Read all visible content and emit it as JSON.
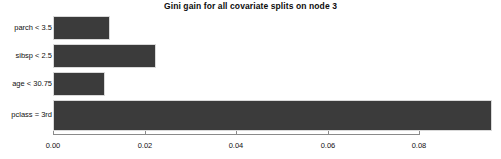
{
  "chart_data": {
    "type": "bar",
    "orientation": "horizontal",
    "title": "Gini gain for all covariate splits on node 3",
    "xlabel": "",
    "ylabel": "",
    "categories": [
      "parch < 3.5",
      "sibsp < 2.5",
      "age < 30.75",
      "pclass = 3rd"
    ],
    "values": [
      0.0125,
      0.0225,
      0.0114,
      0.096
    ],
    "xlim": [
      0.0,
      0.098
    ],
    "xticks": [
      0.0,
      0.02,
      0.04,
      0.06,
      0.08
    ],
    "xtick_labels": [
      "0.00",
      "0.02",
      "0.04",
      "0.06",
      "0.08"
    ],
    "grid": false,
    "legend": false,
    "bar_color": "#3b3b3b",
    "bar_border_color": "#d9d9d9",
    "axis_color": "#8a8a8a",
    "background_color": "#ffffff"
  }
}
